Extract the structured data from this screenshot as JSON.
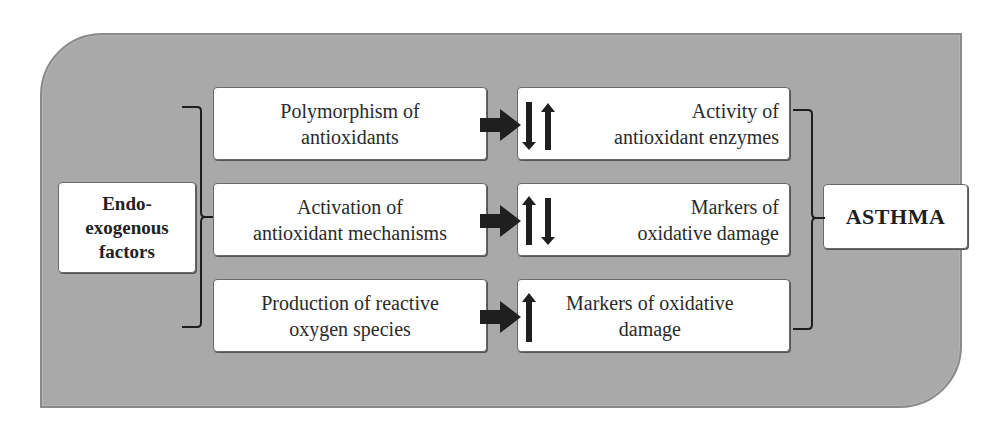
{
  "diagram": {
    "source": {
      "label": "Endo-\nexogenous\nfactors",
      "lines": [
        "Endo-",
        "exogenous",
        "factors"
      ]
    },
    "mechanisms": [
      {
        "lines": [
          "Polymorphism of",
          "antioxidants"
        ]
      },
      {
        "lines": [
          "Activation of",
          "antioxidant mechanisms"
        ]
      },
      {
        "lines": [
          "Production of reactive",
          "oxygen species"
        ]
      }
    ],
    "effects": [
      {
        "lines": [
          "Activity of",
          "antioxidant enzymes"
        ],
        "indicators": [
          "down-arrow",
          "up-arrow"
        ]
      },
      {
        "lines": [
          "Markers of",
          "oxidative damage"
        ],
        "indicators": [
          "up-arrow",
          "down-arrow"
        ]
      },
      {
        "lines": [
          "Markers of oxidative",
          "damage"
        ],
        "indicators": [
          "up-arrow"
        ]
      }
    ],
    "outcome": {
      "label": "ASTHMA"
    },
    "colors": {
      "panel": "#a9a9a9",
      "box": "#ffffff",
      "arrow": "#222222",
      "text": "#2a2a2a"
    }
  }
}
